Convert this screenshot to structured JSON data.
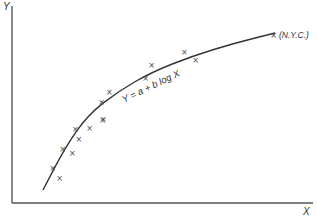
{
  "chart_data": {
    "type": "scatter",
    "title": "",
    "xlabel": "X",
    "ylabel": "Y",
    "grid": false,
    "legend": null,
    "ticks": {
      "x": [],
      "y": []
    },
    "fit": {
      "label": "Y = a + b log X",
      "form": "logarithmic"
    },
    "annotations": [
      {
        "text": "(N.Y.C.)",
        "attached_to_point_index": 15
      }
    ],
    "points_pixel_note": "Unlabeled axes; points given in relative units (0-100) measured from plot origin",
    "points": [
      {
        "x": 13.3,
        "y": 17.8
      },
      {
        "x": 15.6,
        "y": 12.7
      },
      {
        "x": 16.6,
        "y": 27.4
      },
      {
        "x": 19.9,
        "y": 25.4
      },
      {
        "x": 20.9,
        "y": 37.6
      },
      {
        "x": 22.0,
        "y": 32.5
      },
      {
        "x": 25.6,
        "y": 38.1
      },
      {
        "x": 29.9,
        "y": 42.1
      },
      {
        "x": 29.6,
        "y": 51.3
      },
      {
        "x": 30.2,
        "y": 42.6
      },
      {
        "x": 32.2,
        "y": 56.3
      },
      {
        "x": 44.2,
        "y": 63.5
      },
      {
        "x": 46.2,
        "y": 70.1
      },
      {
        "x": 57.1,
        "y": 76.6
      },
      {
        "x": 60.8,
        "y": 72.6
      },
      {
        "x": 86.7,
        "y": 85.3
      }
    ],
    "curve": [
      {
        "x": 10.3,
        "y": 6.6
      },
      {
        "x": 17.6,
        "y": 28.0
      },
      {
        "x": 25.2,
        "y": 44.7
      },
      {
        "x": 35.5,
        "y": 56.9
      },
      {
        "x": 46.5,
        "y": 66.5
      },
      {
        "x": 60.0,
        "y": 74.6
      },
      {
        "x": 74.1,
        "y": 81.2
      },
      {
        "x": 87.4,
        "y": 86.3
      }
    ]
  },
  "labels": {
    "y_axis": "Y",
    "x_axis": "X",
    "equation": "Y = a + b log X",
    "nyc": "(N.Y.C.)",
    "marker_glyph": "×"
  }
}
